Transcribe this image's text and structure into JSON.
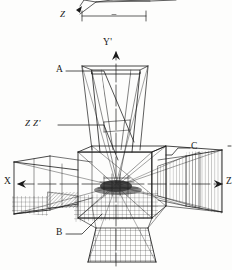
{
  "figure": {
    "kind": "engineering-wireframe-perspective",
    "background_color": "#fdfdfc",
    "ink_color": "#1a1a1a"
  },
  "axes": [
    {
      "id": "y-axis",
      "label": "Y'",
      "direction": "up",
      "x": 106,
      "y": 44
    },
    {
      "id": "x-axis",
      "label": "X",
      "direction": "left",
      "x": 6,
      "y": 181
    },
    {
      "id": "z-axis-right",
      "label": "Z",
      "direction": "right",
      "x": 225,
      "y": 181
    },
    {
      "id": "z-top",
      "label": "Z",
      "direction": "upper",
      "x": 60,
      "y": 9
    }
  ],
  "callouts": [
    {
      "id": "callout-a",
      "label": "A",
      "x": 57,
      "y": 67,
      "target_x": 132,
      "target_y": 142
    },
    {
      "id": "callout-zz",
      "label": "Z  Z'",
      "x": 26,
      "y": 121,
      "target_x": 110,
      "target_y": 160
    },
    {
      "id": "callout-c",
      "label": "C",
      "x": 192,
      "y": 144,
      "target_x": 168,
      "target_y": 162
    },
    {
      "id": "callout-b",
      "label": "B",
      "x": 57,
      "y": 230,
      "target_x": 100,
      "target_y": 208
    }
  ],
  "dimension_line": {
    "id": "top-dimension",
    "x1": 82,
    "x2": 146,
    "y": 16,
    "has_end_ticks": true
  },
  "structure": {
    "center_box": {
      "x": 74,
      "y": 148,
      "w": 84,
      "h": 72
    },
    "horns": [
      {
        "id": "horn-top",
        "direction": "up"
      },
      {
        "id": "horn-bottom",
        "direction": "down"
      },
      {
        "id": "horn-left",
        "direction": "left"
      },
      {
        "id": "horn-right",
        "direction": "right"
      }
    ]
  }
}
